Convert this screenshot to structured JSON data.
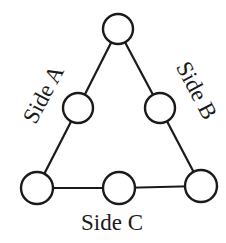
{
  "diagram": {
    "type": "triangle-node-graph",
    "colors": {
      "stroke": "#1a1a1a",
      "node_fill": "#ffffff",
      "background": "#ffffff"
    },
    "nodes": [
      {
        "id": "top",
        "cx": 118,
        "cy": 29,
        "r": 15
      },
      {
        "id": "mid-left",
        "cx": 78,
        "cy": 108,
        "r": 15
      },
      {
        "id": "mid-right",
        "cx": 160,
        "cy": 108,
        "r": 15
      },
      {
        "id": "bottom-left",
        "cx": 37,
        "cy": 188,
        "r": 16
      },
      {
        "id": "bottom-middle",
        "cx": 119,
        "cy": 188,
        "r": 16
      },
      {
        "id": "bottom-right",
        "cx": 201,
        "cy": 186,
        "r": 16
      }
    ],
    "labels": {
      "side_a": "Side A",
      "side_b": "Side B",
      "side_c": "Side C"
    }
  }
}
